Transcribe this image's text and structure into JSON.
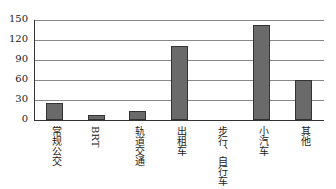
{
  "chart_data": {
    "type": "bar",
    "title": "",
    "xlabel": "",
    "ylabel": "",
    "categories": [
      "常规公交",
      "BRT",
      "轨道交通",
      "出租车",
      "步行、自行车",
      "小汽车",
      "其他"
    ],
    "values": [
      26,
      8,
      14,
      111,
      0,
      142,
      60
    ],
    "ylim": [
      0,
      150
    ],
    "yticks": [
      "0",
      "30",
      "60",
      "90",
      "120",
      "150"
    ],
    "grid": true,
    "legend": null,
    "bar_color": "#6a6a6a"
  }
}
